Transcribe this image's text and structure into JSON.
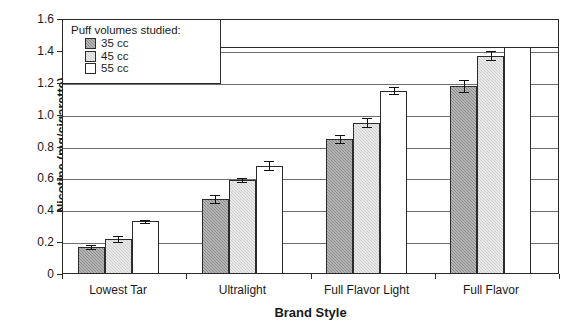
{
  "chart_data": {
    "type": "bar",
    "title": "",
    "xlabel": "Brand Style",
    "ylabel": "Nicotine (mg/cigarette)",
    "categories": [
      "Lowest Tar",
      "Ultralight",
      "Full Flavor Light",
      "Full Flavor"
    ],
    "series": [
      {
        "name": "35 cc",
        "color": "#8c8c8c",
        "values": [
          0.17,
          0.47,
          0.85,
          1.18
        ],
        "errors": [
          0.012,
          0.025,
          0.025,
          0.035
        ]
      },
      {
        "name": "45 cc",
        "color": "#cfcfcf",
        "values": [
          0.22,
          0.59,
          0.95,
          1.37
        ],
        "errors": [
          0.018,
          0.01,
          0.03,
          0.03
        ]
      },
      {
        "name": "55 cc",
        "color": "#ffffff",
        "values": [
          0.33,
          0.68,
          1.15,
          1.49
        ],
        "errors": [
          0.008,
          0.03,
          0.022,
          0.04
        ]
      }
    ],
    "ylim": [
      0,
      1.6
    ],
    "ytick_values": [
      0,
      0.2,
      0.4,
      0.6,
      0.8,
      1.0,
      1.2,
      1.4,
      1.6
    ],
    "ytick_labels": [
      "0",
      "0.2",
      "0.4",
      "0.6",
      "0.8",
      "1.0",
      "1.2",
      "1.4",
      "1.6"
    ],
    "grid": "horizontal",
    "legend_position": "top-left-inside",
    "error_bar_type": "standard-error"
  },
  "legend": {
    "title": "Puff volumes studied:",
    "entries": [
      {
        "label": "35 cc",
        "swatch": "dark-gray-hatched"
      },
      {
        "label": "45 cc",
        "swatch": "light-gray-hatched"
      },
      {
        "label": "55 cc",
        "swatch": "white"
      }
    ]
  },
  "axes": {
    "y_title": "Nicotine (mg/cigarette)",
    "x_title": "Brand Style"
  }
}
